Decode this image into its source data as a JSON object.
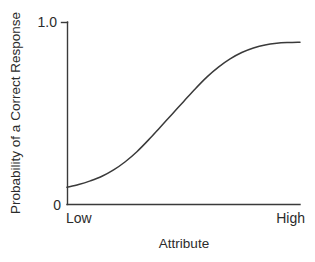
{
  "chart_data": {
    "type": "line",
    "title": "",
    "xlabel": "Attribute",
    "ylabel": "Probability of a Correct Response",
    "ylim": [
      0,
      1.0
    ],
    "xlim": [
      0,
      1
    ],
    "grid": false,
    "legend": "none",
    "ytick_labels": [
      "0",
      "1.0"
    ],
    "ytick_values": [
      0,
      1.0
    ],
    "xtick_labels": [
      "Low",
      "High"
    ],
    "xtick_values": [
      0,
      1
    ],
    "series": [
      {
        "name": "Item characteristic curve",
        "x": [
          0.0,
          0.05,
          0.1,
          0.15,
          0.2,
          0.25,
          0.3,
          0.35,
          0.4,
          0.45,
          0.5,
          0.55,
          0.6,
          0.65,
          0.7,
          0.75,
          0.8,
          0.85,
          0.9,
          0.95,
          1.0
        ],
        "values": [
          0.095,
          0.11,
          0.13,
          0.155,
          0.19,
          0.235,
          0.29,
          0.355,
          0.425,
          0.495,
          0.565,
          0.635,
          0.7,
          0.755,
          0.8,
          0.835,
          0.86,
          0.877,
          0.886,
          0.89,
          0.892
        ]
      }
    ]
  },
  "axes": {
    "y_top_label": "1.0",
    "y_bottom_label": "0",
    "x_left_label": "Low",
    "x_right_label": "High",
    "y_axis_title": "Probability of a Correct Response",
    "x_axis_title": "Attribute"
  },
  "colors": {
    "line": "#3a3a3a",
    "text": "#2b2b2b",
    "background": "#ffffff"
  }
}
